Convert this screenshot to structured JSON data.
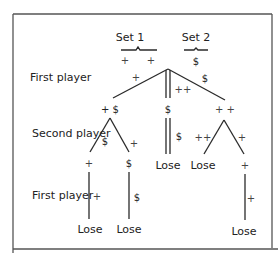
{
  "figure": {
    "sets": [
      {
        "label": "Set 1",
        "items": [
          "+",
          "+"
        ]
      },
      {
        "label": "Set 2",
        "items": [
          "$"
        ]
      }
    ],
    "row_labels": {
      "first_player_top": "First player",
      "second_player": "Second player",
      "first_player_bottom": "First player"
    },
    "root_moves": {
      "left": "+",
      "middle": "++",
      "right": "$"
    },
    "level1_nodes": {
      "left": "+ $",
      "middle": "$",
      "right": "+ +"
    },
    "level2_moves": {
      "left_left": "$",
      "left_right": "+",
      "middle": "$",
      "right_left": "++",
      "right_right": "+"
    },
    "level2_nodes": {
      "left_left": "+",
      "left_right": "$",
      "middle": "Lose",
      "right_left": "Lose",
      "right_right": "+"
    },
    "level3_moves": {
      "left_left": "+",
      "left_right": "$",
      "right_right": "+"
    },
    "level3_nodes": {
      "left_left": "Lose",
      "left_right": "Lose",
      "right_right": "Lose"
    }
  }
}
